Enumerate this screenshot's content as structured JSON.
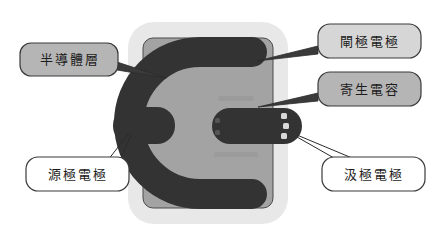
{
  "diagram": {
    "colors": {
      "background": "#ffffff",
      "substrate": "#e8e8e8",
      "semiconductor_layer": "#a3a3a3",
      "electrode": "#333333",
      "callout_fill_dark": "#b5b5b5",
      "callout_fill_mid": "#d6d6d6",
      "callout_fill_light": "#ffffff",
      "outline": "#3a3a3a",
      "leader_line": "#2b2b2b"
    },
    "parts": {
      "substrate": "substrate-plate",
      "semiconductor": "semiconductor-layer-region",
      "gate": "gate-electrode-horseshoe",
      "source": "source-electrode-pad",
      "drain": "drain-electrode-pad",
      "overlap": "parasitic-capacitance-overlap"
    },
    "callouts": [
      {
        "id": "semiconductor-layer",
        "label": "半導體層",
        "fill": "#b5b5b5",
        "position": "left-upper"
      },
      {
        "id": "gate-electrode",
        "label": "閘極電極",
        "fill": "#d6d6d6",
        "position": "right-upper"
      },
      {
        "id": "parasitic-capacitance",
        "label": "寄生電容",
        "fill": "#b5b5b5",
        "position": "right-middle"
      },
      {
        "id": "source-electrode",
        "label": "源極電極",
        "fill": "#ffffff",
        "position": "left-lower"
      },
      {
        "id": "drain-electrode",
        "label": "汲極電極",
        "fill": "#ffffff",
        "position": "right-lower"
      }
    ]
  }
}
